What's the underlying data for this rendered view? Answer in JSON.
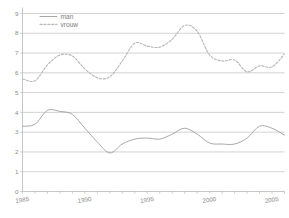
{
  "chart_data": {
    "type": "line",
    "title": "",
    "subtitle": "",
    "xlabel": "",
    "ylabel": "",
    "xlim": [
      1985,
      2006
    ],
    "ylim": [
      0,
      9
    ],
    "grid": true,
    "grid_axis": "y",
    "legend_position": "top-left",
    "x": [
      1985,
      1986,
      1987,
      1988,
      1989,
      1990,
      1991,
      1992,
      1993,
      1994,
      1995,
      1996,
      1997,
      1998,
      1999,
      2000,
      2001,
      2002,
      2003,
      2004,
      2005,
      2006
    ],
    "xticks": [
      1985,
      1990,
      1995,
      2000,
      2005
    ],
    "xtick_labels": [
      "1985",
      "1990",
      "1995",
      "2000",
      "2005"
    ],
    "yticks": [
      0,
      1,
      2,
      3,
      4,
      5,
      6,
      7,
      8,
      9
    ],
    "ytick_labels": [
      "0",
      "1",
      "2",
      "3",
      "4",
      "5",
      "6",
      "7",
      "8",
      "9"
    ],
    "series": [
      {
        "name": "man",
        "style": "solid",
        "color": "#9a9a9a",
        "values": [
          3.3,
          3.4,
          4.1,
          4.05,
          3.9,
          3.2,
          2.5,
          1.95,
          2.4,
          2.65,
          2.7,
          2.65,
          2.9,
          3.2,
          2.9,
          2.45,
          2.4,
          2.4,
          2.7,
          3.3,
          3.2,
          2.85
        ]
      },
      {
        "name": "vrouw",
        "style": "dashed",
        "color": "#b8b8b8",
        "values": [
          5.7,
          5.6,
          6.4,
          6.9,
          6.85,
          6.2,
          5.75,
          5.8,
          6.6,
          7.5,
          7.35,
          7.3,
          7.7,
          8.4,
          8.1,
          6.9,
          6.6,
          6.65,
          6.05,
          6.35,
          6.3,
          6.95
        ]
      }
    ],
    "legend": [
      {
        "label": "man",
        "style": "solid",
        "color": "#9a9a9a"
      },
      {
        "label": "vrouw",
        "style": "dashed",
        "color": "#b8b8b8"
      }
    ],
    "axis_color": "#b0b0b0",
    "grid_color": "#b5b5b5",
    "tick_label_color": "#8a8a8a"
  }
}
